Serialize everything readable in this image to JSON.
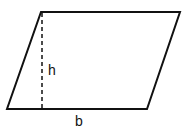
{
  "diagram": {
    "shape": "parallelogram",
    "vertices": {
      "top_left": [
        41,
        12
      ],
      "top_right": [
        180,
        12
      ],
      "bottom_right": [
        147,
        109
      ],
      "bottom_left": [
        7,
        109
      ]
    },
    "height_line": {
      "x": 42,
      "y1": 12,
      "y2": 109,
      "style": "dashed"
    },
    "labels": {
      "height": "h",
      "base": "b"
    },
    "stroke_color": "#111111"
  }
}
